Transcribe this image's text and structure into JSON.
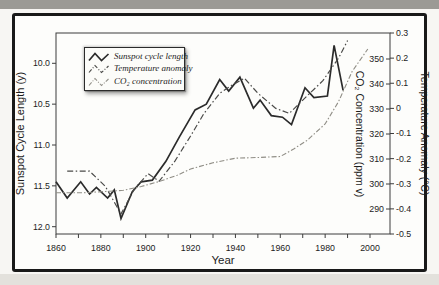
{
  "figure": {
    "kind": "textbook line chart",
    "colors": {
      "frame": "#191919",
      "axis": "#3c3c3c",
      "sunspot_line": "#2b2b2b",
      "temp_line": "#4a4a48",
      "co2_line": "#908e86",
      "top_band": "#9b9a95",
      "bottom_band": "#e3e1dc"
    }
  },
  "chart_data": {
    "type": "line",
    "title": "",
    "xlabel": "Year",
    "x_axis": {
      "label": "Year",
      "range_years": [
        1860,
        2009
      ],
      "tick_years": [
        1860,
        1870,
        1880,
        1890,
        1900,
        1910,
        1920,
        1930,
        1940,
        1950,
        1960,
        1970,
        1980,
        1990,
        2000
      ],
      "label_years": [
        "1860",
        "1880",
        "1900",
        "1920",
        "1940",
        "1960",
        "1980",
        "2000"
      ]
    },
    "left_axis": {
      "label": "Sunspot Cycle Length (y)",
      "inverted": true,
      "range": [
        9.63,
        12.09
      ],
      "tick_values": [
        10.0,
        10.5,
        11.0,
        11.5,
        12.0
      ],
      "tick_labels": [
        "10.0",
        "10.5",
        "11.0",
        "11.5",
        "12.0"
      ]
    },
    "right_axis_co2": {
      "label": "CO₂ Concentration (ppm v)",
      "range": [
        280,
        360
      ],
      "tick_values": [
        350,
        340,
        330,
        320,
        310,
        300,
        290
      ],
      "tick_labels": [
        "350",
        "340",
        "330",
        "320",
        "310",
        "300",
        "290"
      ]
    },
    "right_axis_temp": {
      "label": "Temperature Anomaly (°C)",
      "range": [
        -0.5,
        0.3
      ],
      "tick_values": [
        0.3,
        0.2,
        0.1,
        0,
        -0.1,
        -0.2,
        -0.3,
        -0.4,
        -0.5
      ],
      "tick_labels": [
        "0.3",
        "0.2",
        "0.1",
        "0",
        "-0.1",
        "-0.2",
        "-0.3",
        "-0.4",
        "-0.5"
      ]
    },
    "legend": {
      "position": "top-left",
      "entries": [
        "Sunspot cycle length",
        "Temperature anomaly",
        "CO₂ concentration"
      ]
    },
    "series": [
      {
        "name": "Sunspot cycle length",
        "axis": "sunspot",
        "style": "solid-dark",
        "units": "years",
        "points": [
          [
            1860,
            11.45
          ],
          [
            1865,
            11.65
          ],
          [
            1871,
            11.45
          ],
          [
            1875,
            11.6
          ],
          [
            1878,
            11.52
          ],
          [
            1883,
            11.65
          ],
          [
            1886,
            11.55
          ],
          [
            1889,
            11.9
          ],
          [
            1894,
            11.57
          ],
          [
            1898,
            11.45
          ],
          [
            1903,
            11.43
          ],
          [
            1909,
            11.2
          ],
          [
            1915,
            10.9
          ],
          [
            1922,
            10.57
          ],
          [
            1927,
            10.5
          ],
          [
            1933,
            10.2
          ],
          [
            1937,
            10.34
          ],
          [
            1942,
            10.17
          ],
          [
            1948,
            10.55
          ],
          [
            1951,
            10.45
          ],
          [
            1956,
            10.64
          ],
          [
            1961,
            10.66
          ],
          [
            1965,
            10.75
          ],
          [
            1971,
            10.3
          ],
          [
            1975,
            10.42
          ],
          [
            1981,
            10.4
          ],
          [
            1984,
            9.78
          ],
          [
            1988,
            10.33
          ]
        ]
      },
      {
        "name": "Temperature anomaly",
        "axis": "temp",
        "style": "dashdot-dark",
        "units": "°C",
        "points": [
          [
            1865,
            -0.25
          ],
          [
            1875,
            -0.25
          ],
          [
            1882,
            -0.31
          ],
          [
            1889,
            -0.42
          ],
          [
            1895,
            -0.32
          ],
          [
            1901,
            -0.26
          ],
          [
            1906,
            -0.29
          ],
          [
            1913,
            -0.21
          ],
          [
            1920,
            -0.11
          ],
          [
            1926,
            -0.02
          ],
          [
            1933,
            0.06
          ],
          [
            1938,
            0.09
          ],
          [
            1944,
            0.12
          ],
          [
            1950,
            0.06
          ],
          [
            1958,
            0.0
          ],
          [
            1964,
            -0.02
          ],
          [
            1972,
            0.05
          ],
          [
            1979,
            0.11
          ],
          [
            1986,
            0.2
          ],
          [
            1990,
            0.27
          ]
        ]
      },
      {
        "name": "CO₂ concentration",
        "axis": "co2",
        "style": "dashdot-light",
        "units": "ppm v",
        "points": [
          [
            1860,
            296.5
          ],
          [
            1872,
            296.5
          ],
          [
            1882,
            297
          ],
          [
            1890,
            297.5
          ],
          [
            1898,
            299
          ],
          [
            1906,
            301
          ],
          [
            1914,
            303.5
          ],
          [
            1920,
            306
          ],
          [
            1930,
            308.5
          ],
          [
            1940,
            310.3
          ],
          [
            1950,
            310.6
          ],
          [
            1960,
            311
          ],
          [
            1966,
            314
          ],
          [
            1972,
            317.5
          ],
          [
            1980,
            324
          ],
          [
            1986,
            333
          ],
          [
            1992,
            345
          ],
          [
            1999,
            354
          ]
        ]
      }
    ]
  }
}
